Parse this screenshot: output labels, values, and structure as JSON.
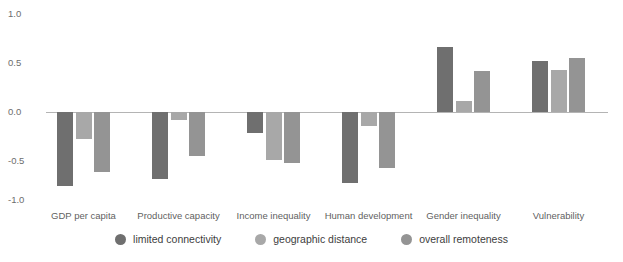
{
  "chart_data": {
    "type": "bar",
    "title": "",
    "subtitle": "",
    "xlabel": "",
    "ylabel": "",
    "ylim": [
      -1.0,
      1.0
    ],
    "grid": false,
    "legend_position": "bottom",
    "orientation": "vertical",
    "categories": [
      "GDP per capita",
      "Productive capacity",
      "Income inequality",
      "Human development",
      "Gender inequality",
      "Vulnerability"
    ],
    "y_ticks": [
      "1.0",
      "0.5",
      "0.0",
      "-0.5",
      "-1.0"
    ],
    "y_tick_values": [
      1.0,
      0.5,
      0.0,
      -0.5,
      -1.0
    ],
    "series": [
      {
        "name": "limited connectivity",
        "color": "#6f6f6f",
        "values": [
          -0.76,
          -0.68,
          -0.21,
          -0.72,
          0.66,
          0.52
        ]
      },
      {
        "name": "geographic distance",
        "color": "#a8a8a8",
        "values": [
          -0.28,
          -0.08,
          -0.49,
          -0.14,
          0.11,
          0.43
        ]
      },
      {
        "name": "overall remoteness",
        "color": "#949494",
        "values": [
          -0.61,
          -0.45,
          -0.52,
          -0.57,
          0.42,
          0.55
        ]
      }
    ]
  },
  "axis": {
    "zero_line_color": "#b4b4b4",
    "tick_label_color": "#6d6d6d",
    "category_label_color": "#5f5f5f"
  }
}
